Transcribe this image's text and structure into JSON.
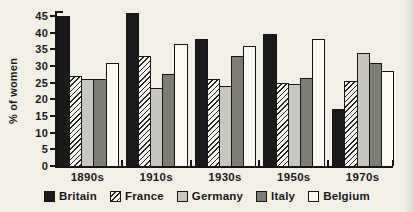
{
  "figure": {
    "background": "#f2efe7",
    "ink": "#1a1a1a"
  },
  "chart_data": {
    "type": "bar",
    "title": "",
    "xlabel": "",
    "ylabel": "% of women",
    "categories": [
      "1890s",
      "1910s",
      "1930s",
      "1950s",
      "1970s"
    ],
    "series": [
      {
        "name": "Britain",
        "style": "solid-black",
        "color": "#1a1a1a",
        "values": [
          45,
          46,
          38,
          39.5,
          17
        ]
      },
      {
        "name": "France",
        "style": "diagonal-hatch",
        "color": "#f8f7f1",
        "values": [
          27,
          33,
          26,
          25,
          25.5
        ]
      },
      {
        "name": "Germany",
        "style": "solid-light-gray",
        "color": "#c7c6c0",
        "values": [
          26,
          23.5,
          24,
          24.5,
          34
        ]
      },
      {
        "name": "Italy",
        "style": "solid-dark-gray",
        "color": "#7d7c75",
        "values": [
          26,
          27.5,
          33,
          26.5,
          31
        ]
      },
      {
        "name": "Belgium",
        "style": "solid-white",
        "color": "#faf9f3",
        "values": [
          31,
          36.5,
          36,
          38,
          28.5
        ]
      }
    ],
    "y_ticks": [
      0,
      5,
      10,
      15,
      20,
      25,
      30,
      35,
      40,
      45
    ],
    "ylim": [
      0,
      45
    ],
    "grid": false,
    "legend_position": "bottom"
  }
}
